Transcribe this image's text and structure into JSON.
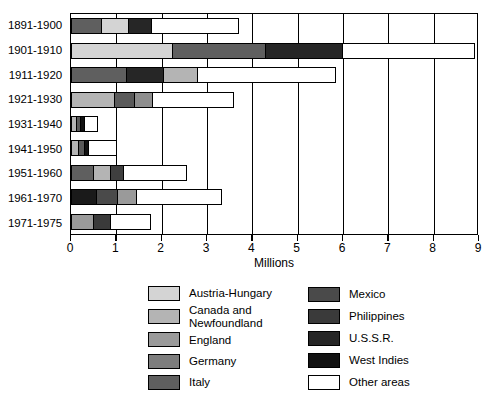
{
  "chart_data": {
    "type": "bar",
    "orientation": "horizontal",
    "stacked": true,
    "title": "",
    "xlabel": "Millions",
    "ylabel": "",
    "xlim": [
      0,
      9
    ],
    "xticks": [
      0,
      1,
      2,
      3,
      4,
      5,
      6,
      7,
      8,
      9
    ],
    "xticklabels": [
      "0",
      "1",
      "2",
      "3",
      "4",
      "5",
      "6",
      "7",
      "8",
      "9"
    ],
    "grid": true,
    "legend_position": "below",
    "categories": [
      "1891-1900",
      "1901-1910",
      "1911-1920",
      "1921-1930",
      "1931-1940",
      "1941-1950",
      "1951-1960",
      "1961-1970",
      "1971-1975"
    ],
    "series": [
      {
        "name": "Austria-Hungary",
        "color": "#d4d4d4",
        "values": [
          0.6,
          2.25,
          0.0,
          0.0,
          0.0,
          0.0,
          0.0,
          0.0,
          0.0
        ]
      },
      {
        "name": "Canada and Newfoundland",
        "color": "#b4b4b4",
        "values": [
          0.0,
          0.0,
          0.75,
          0.95,
          0.11,
          0.17,
          0.38,
          0.42,
          0.0
        ]
      },
      {
        "name": "England",
        "color": "#9a9a9a",
        "values": [
          0.0,
          0.0,
          0.0,
          0.0,
          0.0,
          0.0,
          0.0,
          0.0,
          0.33
        ]
      },
      {
        "name": "Germany",
        "color": "#7d7d7d",
        "values": [
          0.0,
          0.0,
          0.0,
          0.42,
          0.1,
          0.1,
          0.3,
          0.42,
          0.0
        ]
      },
      {
        "name": "Italy",
        "color": "#5f5f5f",
        "values": [
          0.68,
          2.05,
          1.22,
          0.0,
          0.0,
          0.15,
          0.18,
          0.0,
          0.0
        ]
      },
      {
        "name": "Mexico",
        "color": "#4a4a4a",
        "values": [
          0.0,
          0.0,
          0.0,
          0.0,
          0.0,
          0.0,
          0.0,
          0.45,
          0.39
        ]
      },
      {
        "name": "Philippines",
        "color": "#3a3a3a",
        "values": [
          0.0,
          0.0,
          0.0,
          0.0,
          0.0,
          0.0,
          0.0,
          0.0,
          0.0
        ]
      },
      {
        "name": "U.S.S.R.",
        "color": "#262626",
        "values": [
          0.5,
          1.7,
          0.83,
          0.0,
          0.0,
          0.0,
          0.0,
          0.0,
          0.0
        ]
      },
      {
        "name": "West Indies",
        "color": "#121212",
        "values": [
          0.0,
          0.0,
          0.0,
          0.0,
          0.09,
          0.08,
          0.0,
          0.57,
          0.0
        ]
      },
      {
        "name": "Other areas",
        "color": "#ffffff",
        "values": [
          1.92,
          2.92,
          3.05,
          2.23,
          0.3,
          0.52,
          1.4,
          1.89,
          0.9
        ]
      }
    ],
    "bar_totals": [
      3.7,
      8.92,
      5.85,
      3.6,
      0.6,
      1.02,
      2.26,
      3.75,
      1.62
    ],
    "stack_order_per_bar": [
      [
        "Italy",
        "Austria-Hungary",
        "U.S.S.R.",
        "Other areas"
      ],
      [
        "Austria-Hungary",
        "Italy",
        "U.S.S.R.",
        "Other areas"
      ],
      [
        "Italy",
        "U.S.S.R.",
        "Canada and Newfoundland",
        "Other areas"
      ],
      [
        "Canada and Newfoundland",
        "Germany",
        "Canada and Newfoundland",
        "Other areas"
      ],
      [
        "Canada and Newfoundland",
        "Germany",
        "West Indies",
        "Other areas"
      ],
      [
        "Canada and Newfoundland",
        "Germany",
        "West Indies",
        "Italy",
        "Other areas"
      ],
      [
        "Italy",
        "Canada and Newfoundland",
        "Germany",
        "Other areas"
      ],
      [
        "West Indies",
        "Mexico",
        "Canada and Newfoundland",
        "Other areas"
      ],
      [
        "England",
        "Mexico",
        "Other areas"
      ]
    ],
    "bar_segments": [
      [
        {
          "name": "Italy",
          "color": "#5f5f5f",
          "value": 0.68
        },
        {
          "name": "Austria-Hungary",
          "color": "#d4d4d4",
          "value": 0.6
        },
        {
          "name": "U.S.S.R.",
          "color": "#262626",
          "value": 0.5
        },
        {
          "name": "Other areas",
          "color": "#ffffff",
          "value": 1.92
        }
      ],
      [
        {
          "name": "Austria-Hungary",
          "color": "#d4d4d4",
          "value": 2.25
        },
        {
          "name": "Italy",
          "color": "#5f5f5f",
          "value": 2.05
        },
        {
          "name": "U.S.S.R.",
          "color": "#262626",
          "value": 1.7
        },
        {
          "name": "Other areas",
          "color": "#ffffff",
          "value": 2.92
        }
      ],
      [
        {
          "name": "Italy",
          "color": "#5f5f5f",
          "value": 1.22
        },
        {
          "name": "U.S.S.R.",
          "color": "#262626",
          "value": 0.83
        },
        {
          "name": "Canada and Newfoundland",
          "color": "#b4b4b4",
          "value": 0.75
        },
        {
          "name": "Other areas",
          "color": "#ffffff",
          "value": 3.05
        }
      ],
      [
        {
          "name": "Canada and Newfoundland",
          "color": "#b4b4b4",
          "value": 0.95
        },
        {
          "name": "Germany",
          "color": "#5a5a5a",
          "value": 0.45
        },
        {
          "name": "England",
          "color": "#8e8e8e",
          "value": 0.42
        },
        {
          "name": "Other areas",
          "color": "#ffffff",
          "value": 1.78
        }
      ],
      [
        {
          "name": "Canada and Newfoundland",
          "color": "#b4b4b4",
          "value": 0.11
        },
        {
          "name": "Germany",
          "color": "#5a5a5a",
          "value": 0.1
        },
        {
          "name": "West Indies",
          "color": "#121212",
          "value": 0.09
        },
        {
          "name": "Other areas",
          "color": "#ffffff",
          "value": 0.3
        }
      ],
      [
        {
          "name": "Canada and Newfoundland",
          "color": "#b4b4b4",
          "value": 0.17
        },
        {
          "name": "Germany",
          "color": "#5a5a5a",
          "value": 0.12
        },
        {
          "name": "West Indies",
          "color": "#121212",
          "value": 0.1
        },
        {
          "name": "Other areas",
          "color": "#ffffff",
          "value": 0.63
        }
      ],
      [
        {
          "name": "Italy",
          "color": "#5f5f5f",
          "value": 0.49
        },
        {
          "name": "Canada and Newfoundland",
          "color": "#b4b4b4",
          "value": 0.39
        },
        {
          "name": "Germany",
          "color": "#3f3f3f",
          "value": 0.29
        },
        {
          "name": "Other areas",
          "color": "#ffffff",
          "value": 1.39
        }
      ],
      [
        {
          "name": "West Indies",
          "color": "#1a1a1a",
          "value": 0.57
        },
        {
          "name": "Mexico",
          "color": "#4a4a4a",
          "value": 0.46
        },
        {
          "name": "Canada and Newfoundland",
          "color": "#9a9a9a",
          "value": 0.42
        },
        {
          "name": "Other areas",
          "color": "#ffffff",
          "value": 1.89
        }
      ],
      [
        {
          "name": "England",
          "color": "#9a9a9a",
          "value": 0.5
        },
        {
          "name": "Mexico",
          "color": "#3a3a3a",
          "value": 0.39
        },
        {
          "name": "Other areas",
          "color": "#ffffff",
          "value": 0.87
        }
      ]
    ]
  },
  "axis": {
    "x_title": "Millions"
  },
  "legend": {
    "left_column": [
      {
        "label": "Austria-Hungary",
        "color": "#d4d4d4"
      },
      {
        "label": "Canada and\nNewfoundland",
        "color": "#b4b4b4"
      },
      {
        "label": "England",
        "color": "#9a9a9a"
      },
      {
        "label": "Germany",
        "color": "#7d7d7d"
      },
      {
        "label": "Italy",
        "color": "#5f5f5f"
      }
    ],
    "right_column": [
      {
        "label": "Mexico",
        "color": "#4a4a4a"
      },
      {
        "label": "Philippines",
        "color": "#3a3a3a"
      },
      {
        "label": "U.S.S.R.",
        "color": "#262626"
      },
      {
        "label": "West Indies",
        "color": "#121212"
      },
      {
        "label": "Other areas",
        "color": "#ffffff"
      }
    ]
  }
}
